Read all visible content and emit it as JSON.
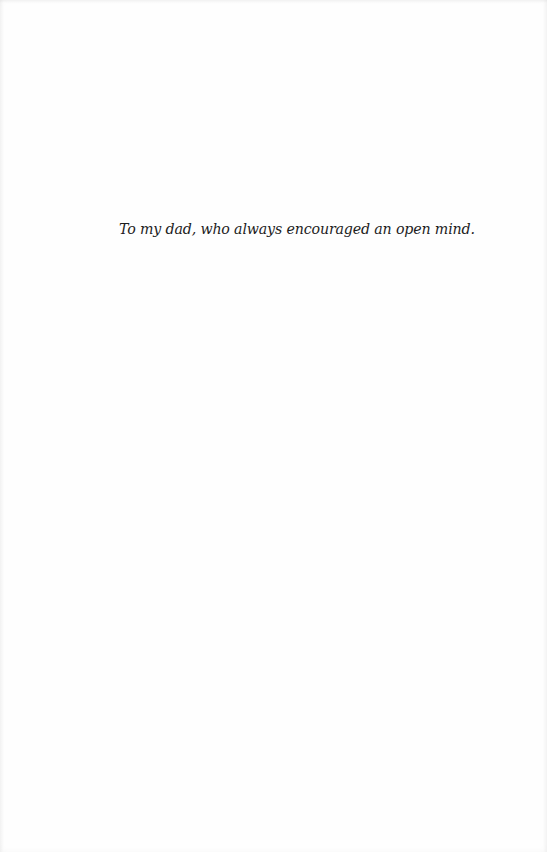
{
  "page": {
    "type": "dedication",
    "dedication_text": "To my dad, who always encouraged an open mind.",
    "colors": {
      "background": "#fefefe",
      "text": "#1c1c1c"
    }
  }
}
